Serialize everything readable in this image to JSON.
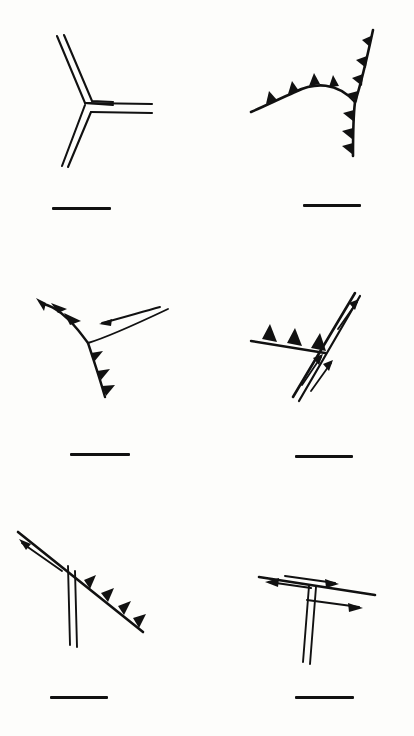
{
  "figure": {
    "title": "Plate boundary triple junction geometries",
    "background_color": "#fdfdfb",
    "ink_color": "#111111",
    "width": 414,
    "height": 736,
    "rows": 3,
    "columns": 2
  },
  "legend": {
    "ridge_symbol_name": "double-line-ridge",
    "trench_symbol_name": "barbed-thrust-teeth",
    "transform_symbol_name": "paired-slip-arrows"
  },
  "panels": [
    {
      "id": "panel-a",
      "position": "top-left",
      "junction_type": "RRR",
      "junction_label": "ridge-ridge-ridge",
      "arms": [
        {
          "name": "arm-upper-left",
          "symbol": "double-line-ridge",
          "bearing_deg": 290
        },
        {
          "name": "arm-lower-left",
          "symbol": "double-line-ridge",
          "bearing_deg": 250
        },
        {
          "name": "arm-east",
          "symbol": "double-line-ridge",
          "bearing_deg": 90
        }
      ],
      "scale_bar": {
        "name": "scale-bar",
        "x": 52,
        "y": 207,
        "length": 59
      }
    },
    {
      "id": "panel-b",
      "position": "top-right",
      "junction_type": "TTT",
      "junction_label": "trench-trench-trench",
      "arms": [
        {
          "name": "arm-northeast",
          "symbol": "barbed-thrust-teeth",
          "teeth": 4,
          "teeth_side": "left"
        },
        {
          "name": "arm-west",
          "symbol": "barbed-thrust-teeth",
          "teeth": 4,
          "teeth_side": "up"
        },
        {
          "name": "arm-south",
          "symbol": "barbed-thrust-teeth",
          "teeth": 3,
          "teeth_side": "left"
        }
      ],
      "scale_bar": {
        "name": "scale-bar",
        "x": 96,
        "y": 204,
        "length": 58
      }
    },
    {
      "id": "panel-c",
      "position": "middle-left",
      "junction_type": "TTF",
      "junction_label": "trench-trench-transform",
      "arms": [
        {
          "name": "arm-northwest-trench",
          "symbol": "barbed-thrust-teeth",
          "teeth": 3,
          "teeth_side": "up-right"
        },
        {
          "name": "arm-south-trench",
          "symbol": "barbed-thrust-teeth",
          "teeth": 3,
          "teeth_side": "right"
        },
        {
          "name": "arm-east-transform",
          "symbol": "paired-slip-arrows",
          "arrow_count": 1,
          "arrow_direction": "left"
        }
      ],
      "scale_bar": {
        "name": "scale-bar",
        "x": 70,
        "y": 208,
        "length": 60
      }
    },
    {
      "id": "panel-d",
      "position": "middle-right",
      "junction_type": "TFF",
      "junction_label": "trench-transform-transform",
      "arms": [
        {
          "name": "arm-west-trench",
          "symbol": "barbed-thrust-teeth",
          "teeth": 3,
          "teeth_side": "up"
        },
        {
          "name": "arm-northeast-transform",
          "symbol": "paired-slip-arrows",
          "arrow_count": 1,
          "arrow_direction": "up-right"
        },
        {
          "name": "arm-southwest-transform",
          "symbol": "paired-slip-arrows",
          "arrow_count": 2,
          "arrow_direction": "up-right"
        }
      ],
      "scale_bar": {
        "name": "scale-bar",
        "x": 88,
        "y": 210,
        "length": 58
      }
    },
    {
      "id": "panel-e",
      "position": "bottom-left",
      "junction_type": "FTR",
      "junction_label": "transform-trench-ridge",
      "arms": [
        {
          "name": "arm-northwest-transform",
          "symbol": "paired-slip-arrows",
          "arrow_count": 1,
          "arrow_direction": "up-left"
        },
        {
          "name": "arm-southeast-trench",
          "symbol": "barbed-thrust-teeth",
          "teeth": 4,
          "teeth_side": "up-right"
        },
        {
          "name": "arm-south-ridge",
          "symbol": "double-line-ridge",
          "bearing_deg": 185
        }
      ],
      "scale_bar": {
        "name": "scale-bar",
        "x": 50,
        "y": 206,
        "length": 58
      }
    },
    {
      "id": "panel-f",
      "position": "bottom-right",
      "junction_type": "FFR",
      "junction_label": "transform-transform-ridge",
      "arms": [
        {
          "name": "arm-west-transform",
          "symbol": "paired-slip-arrows",
          "arrow_count": 2,
          "arrow_direction": "left"
        },
        {
          "name": "arm-east-transform",
          "symbol": "paired-slip-arrows",
          "arrow_count": 2,
          "arrow_direction": "right"
        },
        {
          "name": "arm-south-ridge",
          "symbol": "double-line-ridge",
          "bearing_deg": 182
        }
      ],
      "scale_bar": {
        "name": "scale-bar",
        "x": 88,
        "y": 206,
        "length": 59
      }
    }
  ]
}
